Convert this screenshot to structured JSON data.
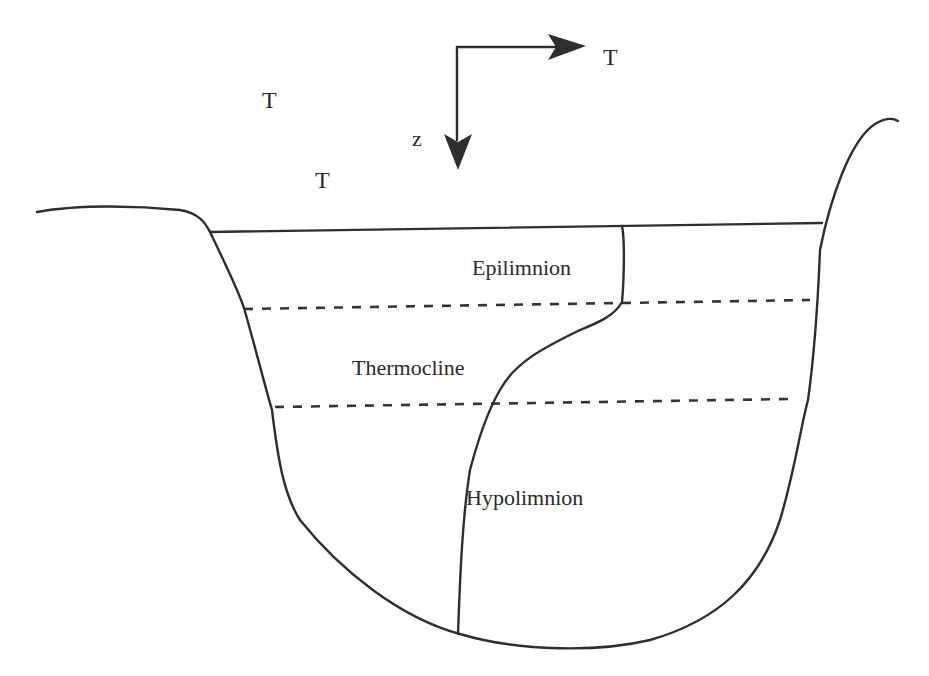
{
  "diagram": {
    "type": "lake thermal stratification cross-section",
    "axes": {
      "horizontal_label": "T",
      "vertical_label": "z"
    },
    "floating_labels": [
      "T",
      "T"
    ],
    "layers": [
      {
        "name": "Epilimnion"
      },
      {
        "name": "Thermocline"
      },
      {
        "name": "Hypolimnion"
      }
    ],
    "colors": {
      "line": "#2e2e2e",
      "background": "#ffffff"
    }
  }
}
